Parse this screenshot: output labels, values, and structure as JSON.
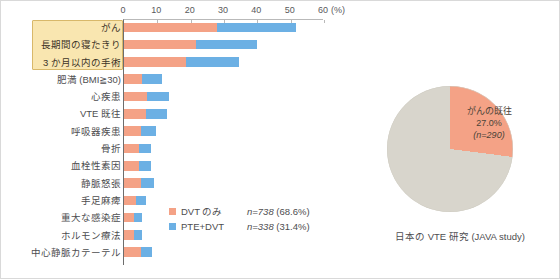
{
  "chart_data": [
    {
      "type": "bar",
      "orientation": "horizontal",
      "stacked": true,
      "title": "",
      "xlabel": "(%)",
      "ylabel": "",
      "xlim": [
        0,
        60
      ],
      "xticks": [
        0,
        10,
        20,
        30,
        40,
        50,
        60
      ],
      "unit_label": "(%)",
      "grid": false,
      "legend_position": "inside-bottom-right",
      "categories": [
        "がん",
        "長期間の寝たきり",
        "3 か月以内の手術",
        "肥満 (BMI≧30)",
        "心疾患",
        "VTE 既往",
        "呼吸器疾患",
        "骨折",
        "血栓性素因",
        "静脈怒張",
        "手足麻痺",
        "重大な感染症",
        "ホルモン療法",
        "中心静脈カテーテル"
      ],
      "highlighted_categories": [
        "がん",
        "長期間の寝たきり",
        "3 か月以内の手術"
      ],
      "series": [
        {
          "name": "DVT のみ",
          "color": "#f4a286",
          "values": [
            28.0,
            21.5,
            18.5,
            5.5,
            7.0,
            6.5,
            5.0,
            4.5,
            4.5,
            5.0,
            3.5,
            3.0,
            3.0,
            5.0
          ]
        },
        {
          "name": "PTE+DVT",
          "color": "#6cb0e4",
          "values": [
            23.5,
            18.5,
            16.0,
            6.0,
            6.5,
            6.5,
            4.5,
            3.5,
            3.5,
            4.0,
            3.0,
            2.5,
            2.5,
            3.5
          ]
        }
      ],
      "legend": [
        {
          "label": "DVT のみ",
          "n": "n=738",
          "pct": "(68.6%)",
          "color": "#f4a286"
        },
        {
          "label": "PTE+DVT",
          "n": "n=338",
          "pct": "(31.4%)",
          "color": "#6cb0e4"
        }
      ]
    },
    {
      "type": "pie",
      "caption": "日本の VTE 研究 (JAVA study)",
      "labels": [
        "がんの既往",
        "その他"
      ],
      "values": [
        27.0,
        73.0
      ],
      "colors": [
        "#f4a286",
        "#d8d5cc"
      ],
      "callout": {
        "line1": "がんの既往",
        "line2": "27.0%",
        "line3": "(n=290)"
      }
    }
  ],
  "axis": {
    "ticks": [
      "0",
      "10",
      "20",
      "30",
      "40",
      "50",
      "60"
    ],
    "unit": "(%)"
  }
}
